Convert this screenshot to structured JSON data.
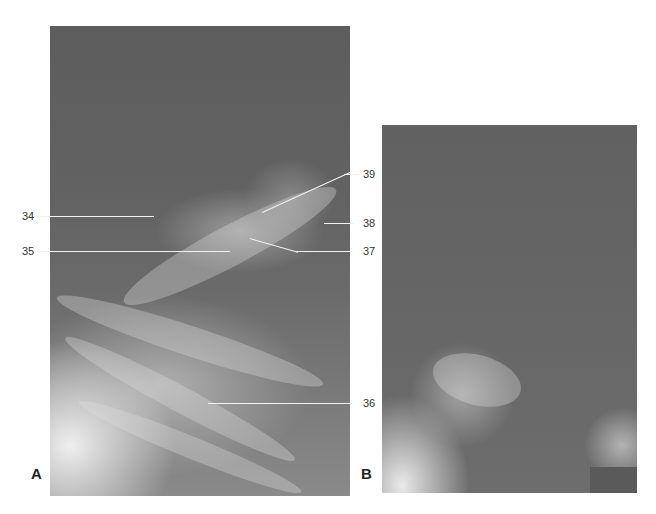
{
  "figure": {
    "panels": [
      {
        "id": "A",
        "letter": "A"
      },
      {
        "id": "B",
        "letter": "B"
      }
    ],
    "labels": {
      "l34": "34",
      "l35": "35",
      "l36": "36",
      "l37": "37",
      "l38": "38",
      "l39": "39"
    },
    "colors": {
      "background": "#ffffff",
      "xray_dark": "#5d5d5d",
      "xray_light": "#e8e8e8",
      "leader_line": "#f2f2f2",
      "label_text": "#333333"
    }
  }
}
